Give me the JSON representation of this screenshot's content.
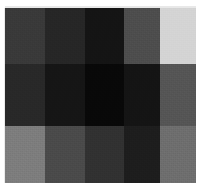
{
  "figure": {
    "kind": "grayscale-patch-grid",
    "background_color": "#ffffff",
    "width": 201,
    "height": 188,
    "plate": {
      "left": 5,
      "top": 8,
      "width": 191,
      "height": 175
    }
  },
  "chart_data": {
    "type": "heatmap",
    "title": "",
    "subtitle": "",
    "xlabel": "",
    "ylabel": "",
    "grid": false,
    "legend": "none",
    "colormap": "grayscale",
    "value_unit": "8-bit gray level",
    "vlim": [
      0,
      255
    ],
    "columns": [
      "c1",
      "c2",
      "c3",
      "c4",
      "c5"
    ],
    "rows": [
      "r1",
      "r2",
      "r3"
    ],
    "column_widths": [
      40,
      40,
      39,
      36,
      36
    ],
    "row_heights": [
      56,
      62,
      57
    ],
    "values": [
      [
        57,
        38,
        20,
        77,
        212
      ],
      [
        40,
        21,
        8,
        20,
        85
      ],
      [
        125,
        74,
        49,
        29,
        110
      ]
    ],
    "colors": [
      [
        "#393939",
        "#262626",
        "#141414",
        "#4d4d4d",
        "#d4d4d4"
      ],
      [
        "#282828",
        "#151515",
        "#080808",
        "#141414",
        "#555555"
      ],
      [
        "#7d7d7d",
        "#4a4a4a",
        "#313131",
        "#1d1d1d",
        "#6e6e6e"
      ]
    ]
  }
}
